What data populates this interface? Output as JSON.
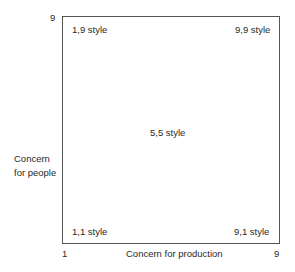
{
  "axes": {
    "y_label_line1": "Concern",
    "y_label_line2": "for people",
    "x_label": "Concern for production",
    "y_max": "9",
    "x_min": "1",
    "x_max": "9"
  },
  "styles": {
    "top_left": "1,9 style",
    "top_right": "9,9 style",
    "center": "5,5 style",
    "bottom_left": "1,1 style",
    "bottom_right": "9,1 style"
  }
}
